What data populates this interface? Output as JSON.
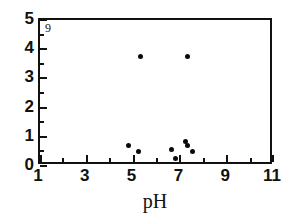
{
  "chart_data": {
    "type": "scatter",
    "title": "",
    "panel_label": "9",
    "xlabel": "pH",
    "ylabel": "",
    "xlim": [
      1,
      11
    ],
    "ylim": [
      0,
      5
    ],
    "grid": false,
    "legend": null,
    "x_major_ticks": [
      1,
      3,
      5,
      7,
      9,
      11
    ],
    "x_minor_ticks": [
      2,
      4,
      6,
      8,
      10
    ],
    "x_tick_labels": [
      "1",
      "3",
      "5",
      "7",
      "9",
      "11"
    ],
    "y_major_ticks": [
      0,
      1,
      2,
      3,
      4,
      5
    ],
    "y_minor_ticks": [
      0.5,
      1.5,
      2.5,
      3.5,
      4.5
    ],
    "y_tick_labels": [
      "0",
      "1",
      "2",
      "3",
      "4",
      "5"
    ],
    "marker": "filled-circle",
    "marker_color": "#0a0a0a",
    "points": [
      {
        "x": 5.3,
        "y": 3.75
      },
      {
        "x": 7.3,
        "y": 3.75
      },
      {
        "x": 4.8,
        "y": 0.7
      },
      {
        "x": 5.2,
        "y": 0.5
      },
      {
        "x": 6.6,
        "y": 0.55
      },
      {
        "x": 6.8,
        "y": 0.25
      },
      {
        "x": 7.2,
        "y": 0.85
      },
      {
        "x": 7.3,
        "y": 0.7
      },
      {
        "x": 7.5,
        "y": 0.5
      }
    ]
  },
  "figure": {
    "background_color": "#ffffff",
    "axis_color": "#111111"
  }
}
